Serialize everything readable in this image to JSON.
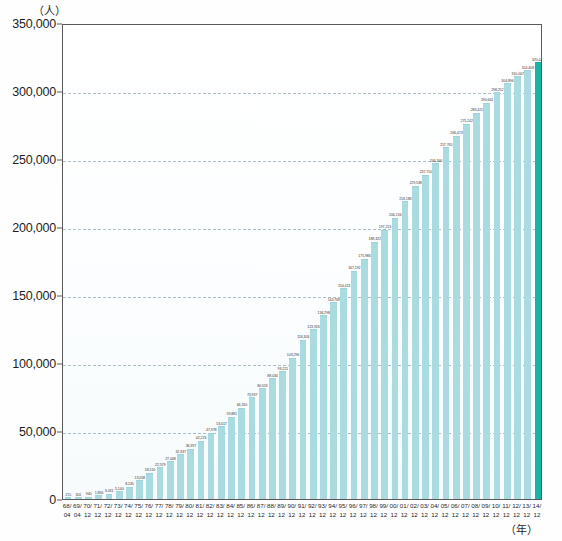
{
  "chart_data": {
    "type": "bar",
    "title": "",
    "subtitle": "",
    "ylabel": "（人）",
    "xlabel": "（年）",
    "ylim": [
      0,
      350000
    ],
    "ytick_values": [
      0,
      50000,
      100000,
      150000,
      200000,
      250000,
      300000,
      350000
    ],
    "ytick_labels": [
      "0",
      "50,000",
      "100,000",
      "150,000",
      "200,000",
      "250,000",
      "300,000",
      "350,000"
    ],
    "grid": true,
    "legend": "none",
    "bar_color": "#a9dbe0",
    "highlight_color": "#18b5a5",
    "highlight_index": 46,
    "categories": [
      "68/04",
      "69/04",
      "70/12",
      "71/12",
      "72/12",
      "73/12",
      "74/12",
      "75/12",
      "76/12",
      "77/12",
      "78/12",
      "79/12",
      "80/12",
      "81/12",
      "82/12",
      "83/12",
      "84/12",
      "85/12",
      "86/12",
      "87/12",
      "88/12",
      "89/12",
      "90/12",
      "91/12",
      "92/12",
      "93/12",
      "94/12",
      "95/12",
      "96/12",
      "97/12",
      "98/12",
      "99/12",
      "00/12",
      "01/12",
      "02/12",
      "03/12",
      "04/12",
      "05/12",
      "06/12",
      "07/12",
      "08/12",
      "09/12",
      "10/12",
      "11/12",
      "12/12",
      "13/12",
      "14/12"
    ],
    "category_years": [
      "68/",
      "69/",
      "70/",
      "71/",
      "72/",
      "73/",
      "74/",
      "75/",
      "76/",
      "77/",
      "78/",
      "79/",
      "80/",
      "81/",
      "82/",
      "83/",
      "84/",
      "85/",
      "86/",
      "87/",
      "88/",
      "89/",
      "90/",
      "91/",
      "92/",
      "93/",
      "94/",
      "95/",
      "96/",
      "97/",
      "98/",
      "99/",
      "00/",
      "01/",
      "02/",
      "03/",
      "04/",
      "05/",
      "06/",
      "07/",
      "08/",
      "09/",
      "10/",
      "11/",
      "12/",
      "13/",
      "14/"
    ],
    "category_months": [
      "04",
      "04",
      "12",
      "12",
      "12",
      "12",
      "12",
      "12",
      "12",
      "12",
      "12",
      "12",
      "12",
      "12",
      "12",
      "12",
      "12",
      "12",
      "12",
      "12",
      "12",
      "12",
      "12",
      "12",
      "12",
      "12",
      "12",
      "12",
      "12",
      "12",
      "12",
      "12",
      "12",
      "12",
      "12",
      "12",
      "12",
      "12",
      "12",
      "12",
      "12",
      "12",
      "12",
      "12",
      "12",
      "12",
      "12"
    ],
    "values": [
      215,
      301,
      940,
      1856,
      3031,
      5140,
      8245,
      13058,
      18510,
      22579,
      27048,
      32337,
      36397,
      42223,
      47978,
      53017,
      59881,
      66310,
      73937,
      80553,
      88034,
      93221,
      103296,
      116303,
      123926,
      134298,
      143769,
      154413,
      167192,
      175986,
      188322,
      197213,
      206134,
      218183,
      229538,
      237710,
      246166,
      257765,
      266473,
      275242,
      283421,
      290661,
      298252,
      304896,
      310007,
      314408,
      320448
    ],
    "value_labels": [
      "215",
      "301",
      "940",
      "1,856",
      "3,031",
      "5,140",
      "8,245",
      "13,058",
      "18,510",
      "22,579",
      "27,048",
      "32,337",
      "36,397",
      "42,223",
      "47,978",
      "53,017",
      "59,881",
      "66,310",
      "73,937",
      "80,553",
      "88,034",
      "93,221",
      "103,296",
      "116,303",
      "123,926",
      "134,298",
      "143,769",
      "154,413",
      "167,192",
      "175,986",
      "188,322",
      "197,213",
      "206,134",
      "218,183",
      "229,538",
      "237,710",
      "246,166",
      "257,765",
      "266,473",
      "275,242",
      "283,421",
      "290,661",
      "298,252",
      "304,896",
      "310,007",
      "314,408",
      "320,448"
    ]
  }
}
